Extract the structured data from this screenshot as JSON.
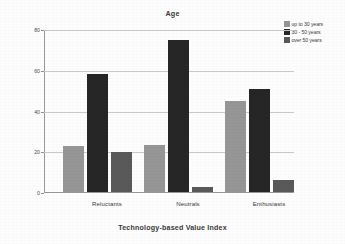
{
  "chart_data": {
    "type": "bar",
    "title": "Age",
    "xlabel": "Technology-based Value Index",
    "ylabel": "Percent within each group",
    "categories": [
      "Reluctants",
      "Neutrals",
      "Enthusiasts"
    ],
    "series": [
      {
        "name": "up to 30 years",
        "color": "#969696",
        "values": [
          22.5,
          23.0,
          44.5
        ]
      },
      {
        "name": "30 - 50 years",
        "color": "#262626",
        "values": [
          58.0,
          74.5,
          50.5
        ]
      },
      {
        "name": "over 50 years",
        "color": "#595959",
        "values": [
          19.5,
          2.5,
          6.0
        ]
      }
    ],
    "ylim": [
      0,
      80
    ],
    "yticks": [
      0,
      20,
      40,
      60,
      80
    ],
    "ytick_labels": [
      "0",
      "20",
      "40",
      "60",
      "80"
    ],
    "grid": true,
    "legend_position": "top-right"
  },
  "axes": {
    "y_title": "Percent within each group",
    "x_title": "Technology-based Value Index"
  },
  "legend": {
    "items": [
      {
        "label": "up to 30 years",
        "color": "#969696"
      },
      {
        "label": "30 - 50 years",
        "color": "#262626"
      },
      {
        "label": "over 50 years",
        "color": "#595959"
      }
    ]
  }
}
